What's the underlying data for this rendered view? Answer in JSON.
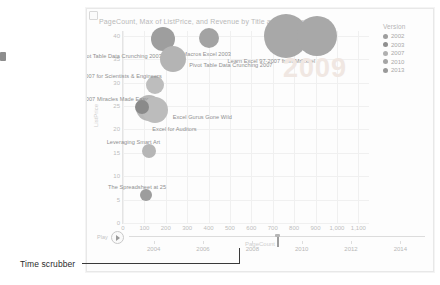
{
  "annotation": {
    "time_scrubber_label": "Time scrubber"
  },
  "report": {
    "title": "PageCount, Max of ListPrice, and Revenue by Title and Version",
    "watermark_year": "2009"
  },
  "legend": {
    "title": "Version",
    "items": [
      {
        "label": "2002",
        "color": "#9e9e9e"
      },
      {
        "label": "2003",
        "color": "#8f8f8f"
      },
      {
        "label": "2007",
        "color": "#b0b0b0"
      },
      {
        "label": "2010",
        "color": "#a5a5a5"
      },
      {
        "label": "2013",
        "color": "#999999"
      }
    ]
  },
  "scrubber": {
    "play_label": "Play",
    "play_icon": "play-icon",
    "current_value": 2009,
    "min": 2003,
    "max": 2015,
    "ticks": [
      "2004",
      "2006",
      "2008",
      "2010",
      "2012",
      "2014"
    ],
    "tick_values": [
      2004,
      2006,
      2008,
      2010,
      2012,
      2014
    ]
  },
  "chart_data": {
    "type": "scatter",
    "title": "PageCount, Max of ListPrice, and Revenue by Title and Version",
    "xlabel": "PageCount",
    "ylabel": "ListPrice",
    "xlim": [
      0,
      1150
    ],
    "ylim": [
      0,
      41
    ],
    "xticks": [
      0,
      100,
      200,
      300,
      400,
      500,
      600,
      700,
      800,
      900,
      1000,
      1100
    ],
    "xtick_labels": [
      "0",
      "100",
      "200",
      "300",
      "400",
      "500",
      "600",
      "700",
      "800",
      "900",
      "1,000",
      "1,100"
    ],
    "yticks": [
      0,
      5,
      10,
      15,
      20,
      25,
      30,
      35,
      40
    ],
    "ytick_labels": [
      "0",
      "5",
      "10",
      "15",
      "20",
      "25",
      "30",
      "35",
      "40"
    ],
    "grid": true,
    "legend_position": "right",
    "size_measure": "Revenue",
    "animation_frame": "2009",
    "points": [
      {
        "label": "Pivot Table Data Crunching 2003",
        "x": 185,
        "y": 39.2,
        "r": 12,
        "color": "#9e9e9e",
        "label_dx": -84,
        "label_dy": 14
      },
      {
        "label": "VBA & Macros Excel 2003",
        "x": 400,
        "y": 39.4,
        "r": 10,
        "color": "#a3a3a3",
        "label_dx": -44,
        "label_dy": 13
      },
      {
        "label": "Pivot Table Data Crunching 2007",
        "x": 235,
        "y": 35.0,
        "r": 13,
        "color": "#b4b4b4",
        "label_dx": 16,
        "label_dy": 3
      },
      {
        "label": "Learn Excel 97-2007 from MrExcel",
        "x": 760,
        "y": 40.0,
        "r": 22,
        "color": "#a8a8a8",
        "label_dx": -58,
        "label_dy": 22
      },
      {
        "label": "",
        "x": 905,
        "y": 40.0,
        "r": 20,
        "color": "#a8a8a8",
        "label_dx": 0,
        "label_dy": 0
      },
      {
        "label": "Excel 2007 for Scientists & Engineers",
        "x": 148,
        "y": 29.4,
        "r": 9,
        "color": "#bdbdbd",
        "label_dx": -88,
        "label_dy": -12
      },
      {
        "label": "Excel 2007 Miracles Made Easy",
        "x": 122,
        "y": 24.5,
        "r": 13,
        "color": "#b8b8b8",
        "label_dx": -82,
        "label_dy": -12
      },
      {
        "label": "Excel Gurus Gone Wild",
        "x": 148,
        "y": 24.2,
        "r": 13,
        "color": "#bcbcbc",
        "label_dx": 18,
        "label_dy": 4
      },
      {
        "label": "Excel for Auditors",
        "x": 90,
        "y": 24.8,
        "r": 7,
        "color": "#8a8a8a",
        "label_dx": 10,
        "label_dy": 19
      },
      {
        "label": "Leveraging Smart Art",
        "x": 120,
        "y": 15.3,
        "r": 7,
        "color": "#b6b6b6",
        "label_dx": -42,
        "label_dy": -12
      },
      {
        "label": "The Spreadsheet at 25",
        "x": 108,
        "y": 5.9,
        "r": 6,
        "color": "#9d9d9d",
        "label_dx": -38,
        "label_dy": -11
      }
    ]
  }
}
